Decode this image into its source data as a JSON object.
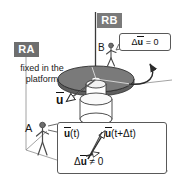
{
  "figure": {
    "background_color": "#ffffff",
    "ink_color": "#1a1a1a"
  },
  "frames": {
    "inertial": {
      "chip_label": "RA",
      "chip_background": "#6e6e6e",
      "chip_text_color": "#ffffff",
      "description_line1": "fixed in the",
      "description_line2": "platform"
    },
    "rotating": {
      "chip_label": "RB",
      "chip_background": "#7a7a7a",
      "chip_text_color": "#ffffff"
    }
  },
  "observers": {
    "ground": {
      "label": "A"
    },
    "platform": {
      "label": "B"
    }
  },
  "vectors": {
    "platform_vector_label": "u"
  },
  "callouts": {
    "observer_b": {
      "delta": "Δ",
      "symbol": "u",
      "relation": "= 0",
      "full_text": "Δū = 0"
    },
    "observer_a": {
      "vector_at_t": {
        "symbol": "u",
        "arg": "(t)"
      },
      "vector_at_t_plus_dt": {
        "symbol": "u",
        "arg": "(t+Δt)"
      },
      "delta_relation": {
        "delta": "Δ",
        "symbol": "u",
        "relation": "≠ 0"
      },
      "full_text": "Δū ≠ 0"
    }
  },
  "platform": {
    "disk_color": "#7a7a7a",
    "disk_edge_color": "#3a3a3a",
    "pedestal_color": "#ffffff",
    "rotation_arrow": "curved-rotation-arrow"
  }
}
